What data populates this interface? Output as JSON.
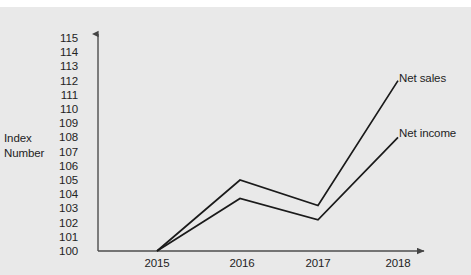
{
  "chart_data": {
    "type": "line",
    "title": "",
    "xlabel": "",
    "ylabel": "Index Number",
    "ylabel_lines": [
      "Index",
      "Number"
    ],
    "categories": [
      "2015",
      "2016",
      "2017",
      "2018"
    ],
    "x": [
      2015,
      2016,
      2017,
      2018
    ],
    "series": [
      {
        "name": "Net sales",
        "values": [
          100,
          105,
          103.2,
          112
        ],
        "color": "#1a1a1a"
      },
      {
        "name": "Net income",
        "values": [
          100,
          103.7,
          102.2,
          108
        ],
        "color": "#1a1a1a"
      }
    ],
    "ylim": [
      100,
      115
    ],
    "yticks": [
      "115",
      "114",
      "113",
      "112",
      "111",
      "110",
      "109",
      "108",
      "107",
      "106",
      "105",
      "104",
      "103",
      "102",
      "101",
      "100"
    ],
    "grid": false,
    "legend_position": "inline-right",
    "axis_arrows": [
      "x-right",
      "y-up"
    ],
    "colors": {
      "background": "#e9e9e9",
      "axis": "#555555",
      "line": "#1a1a1a",
      "text": "#232323"
    }
  }
}
